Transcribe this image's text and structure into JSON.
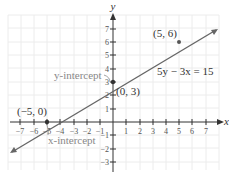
{
  "graph": {
    "equation": "5y − 3x = 15",
    "axes": {
      "x_label": "x",
      "y_label": "y"
    },
    "x_ticks": [
      "−7",
      "−6",
      "−5",
      "−4",
      "−3",
      "−2",
      "−1",
      "1",
      "2",
      "3",
      "4",
      "5",
      "6",
      "7"
    ],
    "y_ticks": [
      "7",
      "6",
      "5",
      "4",
      "3",
      "2",
      "1",
      "−1",
      "−2",
      "−3"
    ],
    "points": [
      {
        "label": "(5, 6)",
        "x": 5,
        "y": 6
      },
      {
        "label": "(0, 3)",
        "x": 0,
        "y": 3
      },
      {
        "label": "(−5, 0)",
        "x": -5,
        "y": 0
      }
    ],
    "annotations": {
      "y_intercept": "y-intercept",
      "x_intercept": "x-intercept"
    },
    "colors": {
      "line": "#666666",
      "axis": "#333333",
      "grid": "#ececec",
      "annotation": "#888888"
    }
  }
}
